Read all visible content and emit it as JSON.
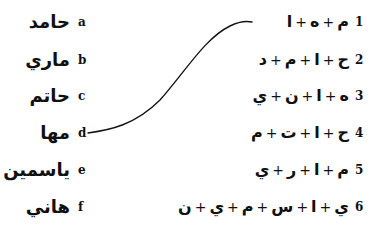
{
  "worksheet": {
    "background_color": "#ffffff",
    "ink_color": "#101010",
    "width": 373,
    "height": 237
  },
  "left_column": {
    "items": [
      {
        "letter": "a",
        "name": "حامد",
        "y": 22
      },
      {
        "letter": "b",
        "name": "ماري",
        "y": 60
      },
      {
        "letter": "c",
        "name": "حاتم",
        "y": 96
      },
      {
        "letter": "d",
        "name": "مها",
        "y": 133
      },
      {
        "letter": "e",
        "name": "ياسمين",
        "y": 170
      },
      {
        "letter": "f",
        "name": "هاني",
        "y": 207
      }
    ]
  },
  "right_column": {
    "items": [
      {
        "number": "1",
        "spelling": "م + ه + ا",
        "letters": [
          "م",
          "ه",
          "ا"
        ],
        "y": 22
      },
      {
        "number": "2",
        "spelling": "ح + ا + م + د",
        "letters": [
          "ح",
          "ا",
          "م",
          "د"
        ],
        "y": 60
      },
      {
        "number": "3",
        "spelling": "ه + ا + ن + ي",
        "letters": [
          "ه",
          "ا",
          "ن",
          "ي"
        ],
        "y": 96
      },
      {
        "number": "4",
        "spelling": "ح + ا + ت + م",
        "letters": [
          "ح",
          "ا",
          "ت",
          "م"
        ],
        "y": 133
      },
      {
        "number": "5",
        "spelling": "م + ا + ر + ي",
        "letters": [
          "م",
          "ا",
          "ر",
          "ي"
        ],
        "y": 170
      },
      {
        "number": "6",
        "spelling": "ي + ا + س + م + ي + ن",
        "letters": [
          "ي",
          "ا",
          "س",
          "م",
          "ي",
          "ن"
        ],
        "y": 207
      }
    ]
  },
  "connections": [
    {
      "from_letter": "d",
      "to_number": "1",
      "path": "M 88 133 C 110 130, 135 125, 160 100 C 185 72, 205 38, 230 26 C 240 21, 247 21, 252 22",
      "stroke": "#151515",
      "stroke_width": 1.4
    }
  ]
}
